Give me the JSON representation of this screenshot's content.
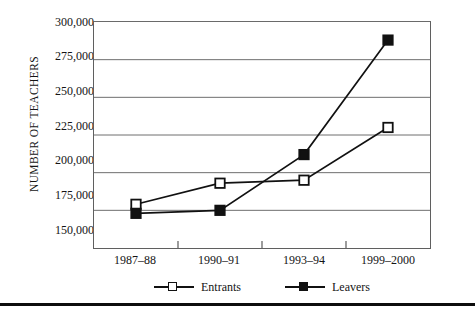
{
  "chart_data": {
    "type": "line",
    "title": "",
    "xlabel": "",
    "ylabel": "NUMBER OF TEACHERS",
    "categories": [
      "1987–88",
      "1990–91",
      "1993–94",
      "1999–2000"
    ],
    "series": [
      {
        "name": "Entrants",
        "marker": "open-square",
        "color": "#111111",
        "values": [
          179000,
          193000,
          195000,
          230000
        ]
      },
      {
        "name": "Leavers",
        "marker": "filled-square",
        "color": "#111111",
        "values": [
          173000,
          175000,
          212000,
          288000
        ]
      }
    ],
    "ylim": [
      150000,
      300000
    ],
    "ytick_step": 25000,
    "ytick_labels": [
      "300,000",
      "275,000",
      "250,000",
      "225,000",
      "200,000",
      "175,000",
      "150,000"
    ],
    "ytick_values": [
      300000,
      275000,
      250000,
      225000,
      200000,
      175000,
      150000
    ],
    "grid": "horizontal",
    "legend_position": "bottom-center"
  },
  "axis": {
    "y_title": "NUMBER OF TEACHERS"
  },
  "legend": {
    "entries": [
      {
        "label": "Entrants",
        "marker": "open-square"
      },
      {
        "label": "Leavers",
        "marker": "filled-square"
      }
    ]
  }
}
